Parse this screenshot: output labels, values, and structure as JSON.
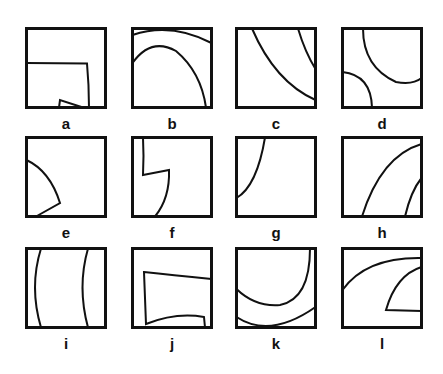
{
  "figure": {
    "stroke_color": "#111111",
    "background": "#ffffff",
    "panels": [
      {
        "id": "a",
        "label": "a",
        "description": "Rectangle-like region from left edge with small wedge at bottom"
      },
      {
        "id": "b",
        "label": "b",
        "description": "Two concentric arcs, inner arc descending to bottom-right"
      },
      {
        "id": "c",
        "label": "c",
        "description": "Two arcs from top curving to right edge"
      },
      {
        "id": "d",
        "label": "d",
        "description": "Quarter arc bottom-left and arc top-right"
      },
      {
        "id": "e",
        "label": "e",
        "description": "Wedge shape on left edge"
      },
      {
        "id": "f",
        "label": "f",
        "description": "Stepped curve from top-left descending to bottom"
      },
      {
        "id": "g",
        "label": "g",
        "description": "Single arc from top to left edge"
      },
      {
        "id": "h",
        "label": "h",
        "description": "Two arcs from bottom curving to right edge"
      },
      {
        "id": "i",
        "label": "i",
        "description": "Two nearly vertical curves"
      },
      {
        "id": "j",
        "label": "j",
        "description": "Trapezoid-like band opening to the right"
      },
      {
        "id": "k",
        "label": "k",
        "description": "Two U-shaped curves"
      },
      {
        "id": "l",
        "label": "l",
        "description": "Arc across top and wedge on right edge"
      }
    ]
  }
}
